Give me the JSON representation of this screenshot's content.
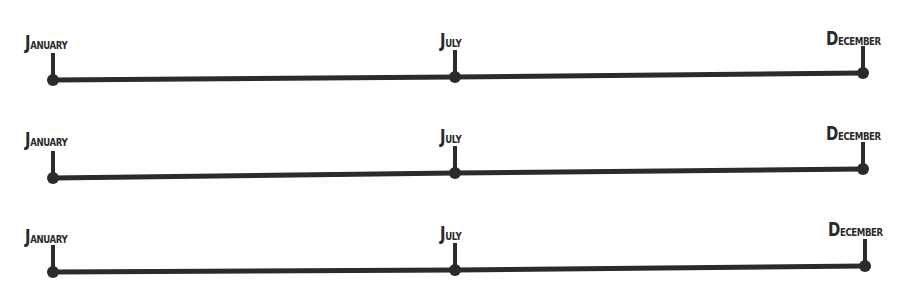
{
  "diagram": {
    "type": "timeline-template",
    "line_color": "#2b2b2b",
    "background": "#ffffff",
    "timelines": [
      {
        "markers": [
          {
            "label": "January",
            "x": 53,
            "y": 80,
            "label_x": 25,
            "label_y": 31
          },
          {
            "label": "July",
            "x": 455,
            "y": 77,
            "label_x": 440,
            "label_y": 29
          },
          {
            "label": "December",
            "x": 863,
            "y": 73,
            "label_x": 826,
            "label_y": 27
          }
        ]
      },
      {
        "markers": [
          {
            "label": "January",
            "x": 53,
            "y": 178,
            "label_x": 25,
            "label_y": 128
          },
          {
            "label": "July",
            "x": 455,
            "y": 173,
            "label_x": 440,
            "label_y": 125
          },
          {
            "label": "December",
            "x": 863,
            "y": 169,
            "label_x": 826,
            "label_y": 122
          }
        ]
      },
      {
        "markers": [
          {
            "label": "January",
            "x": 53,
            "y": 272,
            "label_x": 25,
            "label_y": 225
          },
          {
            "label": "July",
            "x": 455,
            "y": 270,
            "label_x": 440,
            "label_y": 222
          },
          {
            "label": "December",
            "x": 865,
            "y": 266,
            "label_x": 828,
            "label_y": 218
          }
        ]
      }
    ]
  },
  "labels": {
    "t0": {
      "m0": {
        "first": "J",
        "rest": "anuary"
      },
      "m1": {
        "first": "J",
        "rest": "uly"
      },
      "m2": {
        "first": "D",
        "rest": "ecember"
      }
    },
    "t1": {
      "m0": {
        "first": "J",
        "rest": "anuary"
      },
      "m1": {
        "first": "J",
        "rest": "uly"
      },
      "m2": {
        "first": "D",
        "rest": "ecember"
      }
    },
    "t2": {
      "m0": {
        "first": "J",
        "rest": "anuary"
      },
      "m1": {
        "first": "J",
        "rest": "uly"
      },
      "m2": {
        "first": "D",
        "rest": "ecember"
      }
    }
  }
}
